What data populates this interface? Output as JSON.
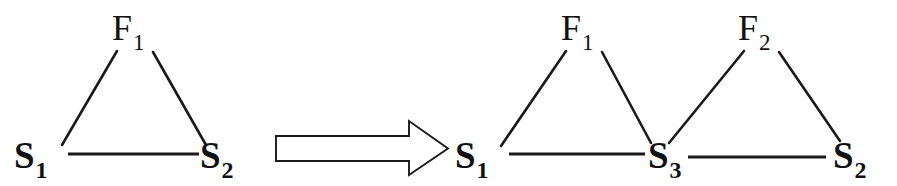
{
  "figure": {
    "background_color": "#ffffff",
    "ink_color": "#1a1a1a"
  },
  "left_graph": {
    "name": "left-triangle-graph",
    "nodes": [
      {
        "id": "F1",
        "base": "F",
        "subscript": "1",
        "role": "function-node",
        "x": 131,
        "y": 30
      },
      {
        "id": "S1",
        "base": "S",
        "subscript": "1",
        "role": "state-node",
        "x": 22,
        "y": 164
      },
      {
        "id": "S2",
        "base": "S",
        "subscript": "2",
        "role": "state-node",
        "x": 203,
        "y": 164
      }
    ],
    "edges": [
      {
        "from": "S1",
        "to": "F1"
      },
      {
        "from": "F1",
        "to": "S2"
      },
      {
        "from": "S1",
        "to": "S2"
      }
    ]
  },
  "transform_arrow": {
    "name": "transform-arrow",
    "direction": "right",
    "style": "hollow-block-arrow"
  },
  "right_graph": {
    "name": "right-double-triangle-graph",
    "nodes": [
      {
        "id": "F1",
        "base": "F",
        "subscript": "1",
        "role": "function-node",
        "x": 580,
        "y": 30
      },
      {
        "id": "F2",
        "base": "F",
        "subscript": "2",
        "role": "function-node",
        "x": 757,
        "y": 30
      },
      {
        "id": "S1",
        "base": "S",
        "subscript": "1",
        "role": "state-node",
        "x": 462,
        "y": 164
      },
      {
        "id": "S3",
        "base": "S",
        "subscript": "3",
        "role": "state-node",
        "x": 652,
        "y": 164
      },
      {
        "id": "S2",
        "base": "S",
        "subscript": "2",
        "role": "state-node",
        "x": 838,
        "y": 164
      }
    ],
    "edges": [
      {
        "from": "S1",
        "to": "F1"
      },
      {
        "from": "F1",
        "to": "S3"
      },
      {
        "from": "S3",
        "to": "F2"
      },
      {
        "from": "F2",
        "to": "S2"
      },
      {
        "from": "S1",
        "to": "S3"
      },
      {
        "from": "S3",
        "to": "S2"
      }
    ]
  },
  "labels": {
    "left_F1_base": "F",
    "left_F1_sub": "1",
    "left_S1_base": "S",
    "left_S1_sub": "1",
    "left_S2_base": "S",
    "left_S2_sub": "2",
    "right_F1_base": "F",
    "right_F1_sub": "1",
    "right_F2_base": "F",
    "right_F2_sub": "2",
    "right_S1_base": "S",
    "right_S1_sub": "1",
    "right_S3_base": "S",
    "right_S3_sub": "3",
    "right_S2_base": "S",
    "right_S2_sub": "2"
  }
}
